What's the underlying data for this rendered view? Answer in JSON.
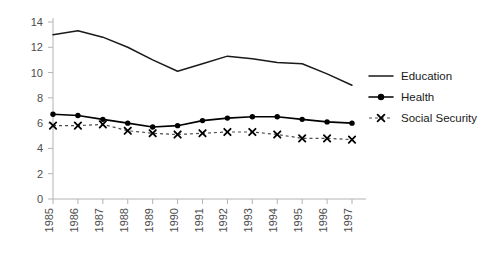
{
  "chart_data": {
    "type": "line",
    "title": "",
    "subtitle": "",
    "xlabel": "",
    "ylabel": "",
    "x": [
      1985,
      1986,
      1987,
      1988,
      1989,
      1990,
      1991,
      1992,
      1993,
      1994,
      1995,
      1996,
      1997
    ],
    "categories": [
      "1985",
      "1986",
      "1987",
      "1988",
      "1989",
      "1990",
      "1991",
      "1992",
      "1993",
      "1994",
      "1995",
      "1996",
      "1997"
    ],
    "xlim": [
      1985,
      1997
    ],
    "ylim": [
      0,
      14
    ],
    "yticks": [
      0,
      2,
      4,
      6,
      8,
      10,
      12,
      14
    ],
    "ytick_labels": [
      "0",
      "2",
      "4",
      "6",
      "8",
      "10",
      "12",
      "14"
    ],
    "grid": false,
    "legend_position": "right",
    "series": [
      {
        "name": "Education",
        "marker": "none",
        "line_style": "solid",
        "color": "#1a1a1a",
        "values": [
          13.0,
          13.3,
          12.8,
          12.0,
          11.0,
          10.1,
          10.7,
          11.3,
          11.1,
          10.8,
          10.7,
          9.9,
          9.0
        ]
      },
      {
        "name": "Health",
        "marker": "circle",
        "line_style": "solid",
        "color": "#000000",
        "values": [
          6.7,
          6.6,
          6.3,
          6.0,
          5.7,
          5.8,
          6.2,
          6.4,
          6.5,
          6.5,
          6.3,
          6.1,
          6.0
        ]
      },
      {
        "name": "Social Security",
        "marker": "x",
        "line_style": "dashed",
        "color": "#4d4d4d",
        "values": [
          5.8,
          5.8,
          5.9,
          5.4,
          5.2,
          5.1,
          5.2,
          5.3,
          5.3,
          5.1,
          4.8,
          4.8,
          4.7
        ]
      }
    ]
  },
  "legend": {
    "items": [
      {
        "label": "Education"
      },
      {
        "label": "Health"
      },
      {
        "label": "Social Security"
      }
    ]
  },
  "colors": {
    "axis": "#b3b3b3",
    "tick_text": "#4d4d4d",
    "education": "#1a1a1a",
    "health": "#000000",
    "social_security": "#4d4d4d",
    "background": "#ffffff"
  }
}
